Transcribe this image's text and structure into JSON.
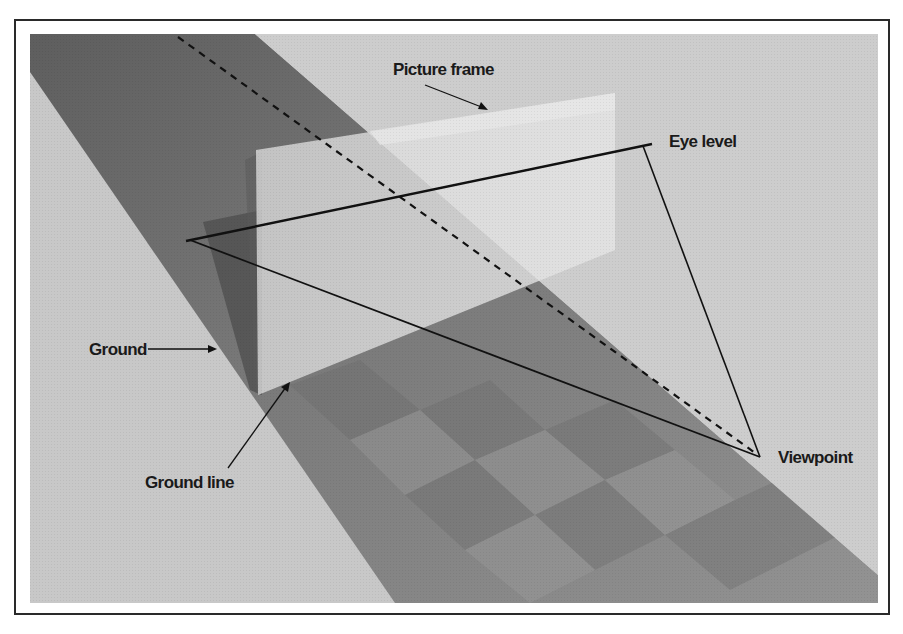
{
  "figure": {
    "labels": {
      "picture_frame": "Picture frame",
      "eye_level": "Eye level",
      "ground": "Ground",
      "ground_line": "Ground line",
      "viewpoint": "Viewpoint"
    },
    "colors": {
      "background": "#c9c9c9",
      "ground_band": "#8f8f8f",
      "ground_band_top": "#6e6e6e",
      "picture_plane": "#dcdcdc",
      "shadow": "#555555",
      "line": "#111111",
      "border": "#2a2a2a"
    },
    "points": {
      "eye_apex": [
        190,
        240
      ],
      "eye_level_end": [
        645,
        145
      ],
      "viewpoint": [
        758,
        455
      ]
    }
  }
}
